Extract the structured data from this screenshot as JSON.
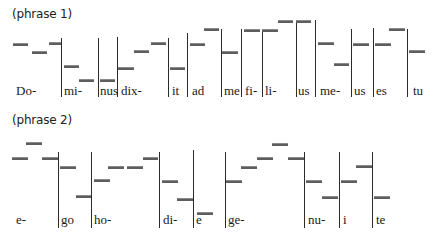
{
  "phrases": [
    {
      "title": "(phrase 1)",
      "title_pos": [
        12,
        7
      ],
      "lyric_top": 84,
      "bar_bottom": 97,
      "lyrics": [
        {
          "text": "Do-",
          "x": 16
        },
        {
          "text": "mi-",
          "x": 64
        },
        {
          "text": "nus",
          "x": 100
        },
        {
          "text": "dix-",
          "x": 121
        },
        {
          "text": "it",
          "x": 172
        },
        {
          "text": "ad",
          "x": 192
        },
        {
          "text": "me",
          "x": 224
        },
        {
          "text": "fi-",
          "x": 245
        },
        {
          "text": "li-",
          "x": 265
        },
        {
          "text": "us",
          "x": 298
        },
        {
          "text": "me-",
          "x": 320
        },
        {
          "text": "us",
          "x": 354
        },
        {
          "text": "es",
          "x": 376
        },
        {
          "text": "tu",
          "x": 413
        }
      ],
      "bars": [
        {
          "x": 61,
          "top": 38
        },
        {
          "x": 98,
          "top": 38
        },
        {
          "x": 117,
          "top": 37
        },
        {
          "x": 168,
          "top": 38
        },
        {
          "x": 187,
          "top": 33
        },
        {
          "x": 221,
          "top": 29
        },
        {
          "x": 241,
          "top": 29
        },
        {
          "x": 262,
          "top": 29
        },
        {
          "x": 296,
          "top": 20
        },
        {
          "x": 315,
          "top": 20
        },
        {
          "x": 351,
          "top": 29
        },
        {
          "x": 373,
          "top": 28
        },
        {
          "x": 407,
          "top": 29
        }
      ],
      "notes": [
        {
          "x": 13,
          "w": 15,
          "y": 43
        },
        {
          "x": 32,
          "w": 15,
          "y": 51
        },
        {
          "x": 49,
          "w": 12,
          "y": 42
        },
        {
          "x": 64,
          "w": 15,
          "y": 65
        },
        {
          "x": 79,
          "w": 15,
          "y": 79
        },
        {
          "x": 100,
          "w": 15,
          "y": 79
        },
        {
          "x": 118,
          "w": 16,
          "y": 67
        },
        {
          "x": 134,
          "w": 15,
          "y": 50
        },
        {
          "x": 151,
          "w": 15,
          "y": 42
        },
        {
          "x": 170,
          "w": 15,
          "y": 67
        },
        {
          "x": 190,
          "w": 15,
          "y": 43
        },
        {
          "x": 204,
          "w": 15,
          "y": 28
        },
        {
          "x": 222,
          "w": 16,
          "y": 51
        },
        {
          "x": 244,
          "w": 16,
          "y": 29
        },
        {
          "x": 262,
          "w": 16,
          "y": 29
        },
        {
          "x": 278,
          "w": 15,
          "y": 20
        },
        {
          "x": 296,
          "w": 15,
          "y": 20
        },
        {
          "x": 318,
          "w": 16,
          "y": 42
        },
        {
          "x": 334,
          "w": 15,
          "y": 63
        },
        {
          "x": 353,
          "w": 16,
          "y": 43
        },
        {
          "x": 375,
          "w": 16,
          "y": 43
        },
        {
          "x": 389,
          "w": 16,
          "y": 28
        },
        {
          "x": 409,
          "w": 16,
          "y": 50
        }
      ]
    },
    {
      "title": "(phrase 2)",
      "title_pos": [
        12,
        113
      ],
      "lyric_top": 213,
      "bar_bottom": 228,
      "lyrics": [
        {
          "text": "e-",
          "x": 16
        },
        {
          "text": "go",
          "x": 61
        },
        {
          "text": "ho-",
          "x": 94
        },
        {
          "text": "di-",
          "x": 163
        },
        {
          "text": "e",
          "x": 196
        },
        {
          "text": "ge-",
          "x": 228
        },
        {
          "text": "nu-",
          "x": 308
        },
        {
          "text": "i",
          "x": 343
        },
        {
          "text": "te",
          "x": 376
        }
      ],
      "bars": [
        {
          "x": 58,
          "top": 152
        },
        {
          "x": 91,
          "top": 152
        },
        {
          "x": 159,
          "top": 152
        },
        {
          "x": 193,
          "top": 150
        },
        {
          "x": 225,
          "top": 152
        },
        {
          "x": 304,
          "top": 152
        },
        {
          "x": 339,
          "top": 152
        },
        {
          "x": 372,
          "top": 152
        }
      ],
      "notes": [
        {
          "x": 12,
          "w": 16,
          "y": 157
        },
        {
          "x": 26,
          "w": 16,
          "y": 142
        },
        {
          "x": 42,
          "w": 16,
          "y": 157
        },
        {
          "x": 60,
          "w": 16,
          "y": 166
        },
        {
          "x": 76,
          "w": 15,
          "y": 195
        },
        {
          "x": 94,
          "w": 16,
          "y": 179
        },
        {
          "x": 108,
          "w": 16,
          "y": 166
        },
        {
          "x": 127,
          "w": 16,
          "y": 166
        },
        {
          "x": 143,
          "w": 15,
          "y": 157
        },
        {
          "x": 162,
          "w": 16,
          "y": 180
        },
        {
          "x": 177,
          "w": 16,
          "y": 198
        },
        {
          "x": 197,
          "w": 16,
          "y": 212
        },
        {
          "x": 226,
          "w": 16,
          "y": 180
        },
        {
          "x": 241,
          "w": 16,
          "y": 166
        },
        {
          "x": 257,
          "w": 16,
          "y": 157
        },
        {
          "x": 272,
          "w": 16,
          "y": 143
        },
        {
          "x": 288,
          "w": 16,
          "y": 157
        },
        {
          "x": 306,
          "w": 16,
          "y": 180
        },
        {
          "x": 322,
          "w": 16,
          "y": 196
        },
        {
          "x": 341,
          "w": 16,
          "y": 180
        },
        {
          "x": 356,
          "w": 16,
          "y": 165
        },
        {
          "x": 374,
          "w": 16,
          "y": 196
        }
      ]
    }
  ]
}
